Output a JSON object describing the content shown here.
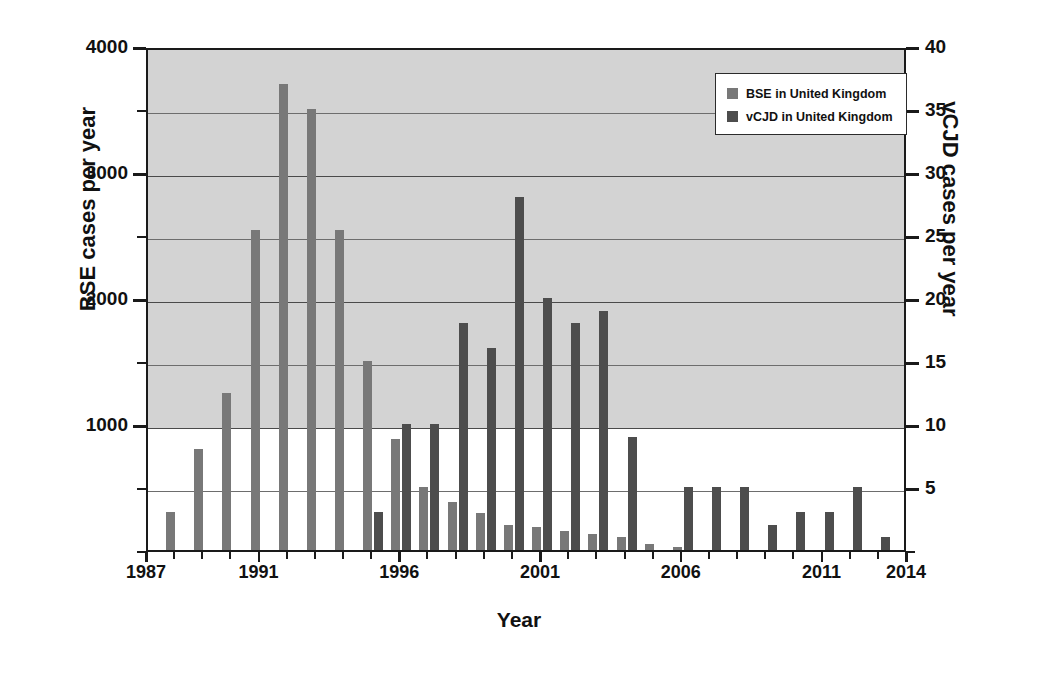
{
  "chart_data": {
    "type": "bar",
    "title": "",
    "xlabel": "Year",
    "ylabel": "BSE cases per year",
    "ylabel_right": "vCJD cases per year",
    "ylim": [
      0,
      4000
    ],
    "ylim_right": [
      0,
      40
    ],
    "grid": true,
    "legend_position": "top-right",
    "x": [
      1987,
      1988,
      1989,
      1990,
      1991,
      1992,
      1993,
      1994,
      1995,
      1996,
      1997,
      1998,
      1999,
      2000,
      2001,
      2002,
      2003,
      2004,
      2005,
      2006,
      2007,
      2008,
      2009,
      2010,
      2011,
      2012,
      2013
    ],
    "categories": [
      "1987",
      "1988",
      "1989",
      "1990",
      "1991",
      "1992",
      "1993",
      "1994",
      "1995",
      "1996",
      "1997",
      "1998",
      "1999",
      "2000",
      "2001",
      "2002",
      "2003",
      "2004",
      "2005",
      "2006",
      "2007",
      "2008",
      "2009",
      "2010",
      "2011",
      "2012",
      "2013"
    ],
    "series": [
      {
        "name": "BSE in United Kingdom",
        "axis": "left",
        "color": "#787878",
        "values": [
          100,
          300,
          800,
          1250,
          2540,
          3700,
          3500,
          2540,
          1500,
          880,
          500,
          380,
          290,
          200,
          180,
          150,
          130,
          100,
          50,
          10,
          0,
          0,
          0,
          0,
          0,
          0,
          0
        ]
      },
      {
        "name": "vCJD in United Kingdom",
        "axis": "right",
        "color": "#4d4d4d",
        "values": [
          0,
          0,
          0,
          0,
          0,
          0,
          0,
          0,
          3,
          10,
          10,
          18,
          16,
          28,
          20,
          18,
          19,
          9,
          0,
          5,
          5,
          5,
          2,
          3,
          3,
          5,
          1
        ]
      }
    ],
    "left_axis": {
      "label": "BSE cases per year",
      "ticks": [
        0,
        500,
        1000,
        1500,
        2000,
        2500,
        3000,
        3500,
        4000
      ],
      "tick_labels": [
        "",
        "",
        "1000",
        "",
        "2000",
        "",
        "3000",
        "",
        "4000"
      ],
      "major_ticks": [
        1000,
        2000,
        3000,
        4000
      ]
    },
    "right_axis": {
      "label": "vCJD cases per year",
      "ticks": [
        0,
        5,
        10,
        15,
        20,
        25,
        30,
        35,
        40
      ],
      "tick_labels": [
        "",
        "5",
        "10",
        "15",
        "20",
        "25",
        "30",
        "35",
        "40"
      ],
      "major_ticks": [
        5,
        10,
        15,
        20,
        25,
        30,
        35,
        40
      ]
    },
    "x_axis": {
      "label": "Year",
      "tick_labels": [
        "1987",
        "1991",
        "1996",
        "2001",
        "2006",
        "2011",
        "2014"
      ],
      "tick_values": [
        1987,
        1991,
        1996,
        2001,
        2006,
        2011,
        2014
      ]
    },
    "legend": [
      {
        "label": "BSE in United Kingdom",
        "color": "#787878"
      },
      {
        "label": "vCJD in United Kingdom",
        "color": "#4d4d4d"
      }
    ],
    "colors": {
      "bse": "#787878",
      "vcjd": "#4d4d4d",
      "shaded_band": "#d3d3d3",
      "axis": "#1a1a1a",
      "gridline": "#6d6d6d",
      "background": "#ffffff"
    }
  }
}
